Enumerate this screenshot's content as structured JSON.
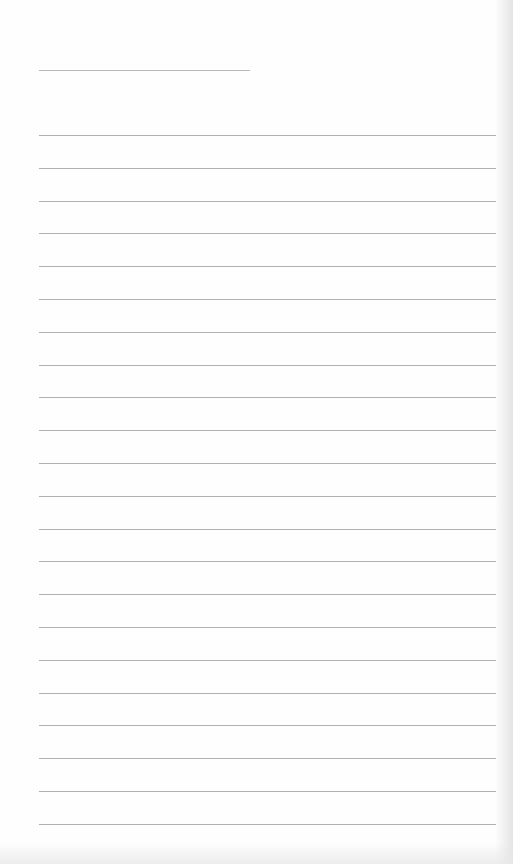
{
  "page": {
    "type": "blank lined paper",
    "background_color": "#fefefe",
    "line_color": "#b0b0b0",
    "title_line": {
      "present": true
    },
    "ruled_lines": {
      "count": 22,
      "spacing_px": 32.8
    }
  }
}
